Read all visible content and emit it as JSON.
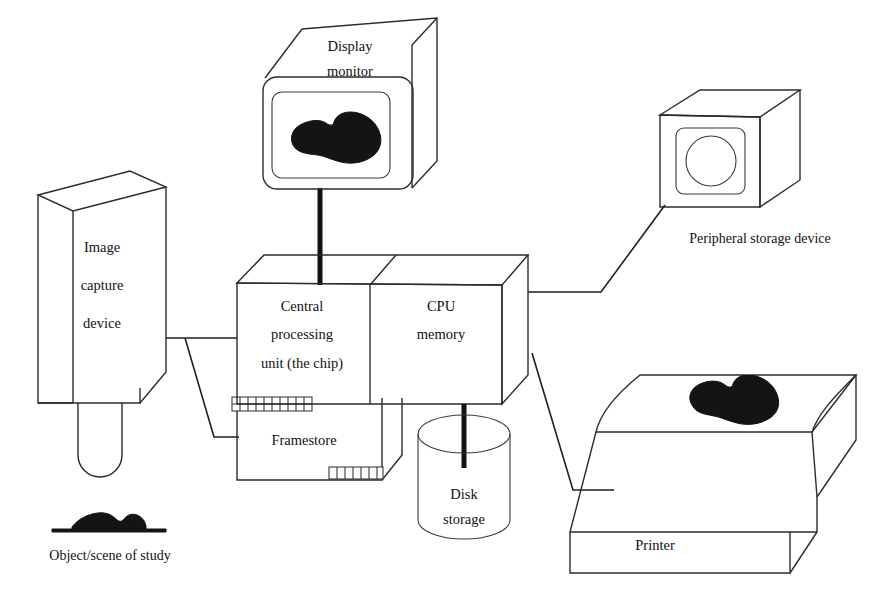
{
  "diagram": {
    "background_color": "#ffffff",
    "line_color": "#2b2b2b",
    "blob_color": "#141414"
  },
  "nodes": {
    "display_monitor": {
      "label_line1": "Display",
      "label_line2": "monitor",
      "icon": "crt-monitor-icon",
      "screen_content": "blob-shape"
    },
    "image_capture_device": {
      "label_line1": "Image",
      "label_line2": "capture",
      "label_line3": "device",
      "icon": "camera-box-icon"
    },
    "central_processing_unit": {
      "label_line1": "Central",
      "label_line2": "processing",
      "label_line3": "unit  (the chip)",
      "icon": "cpu-box-icon"
    },
    "cpu_memory": {
      "label_line1": "CPU",
      "label_line2": "memory",
      "icon": "memory-box-icon"
    },
    "framestore": {
      "label": "Framestore",
      "icon": "framestore-box-icon",
      "chip_combs": 2
    },
    "disk_storage": {
      "label_line1": "Disk",
      "label_line2": "storage",
      "icon": "cylinder-icon"
    },
    "peripheral_storage_device": {
      "label": "Peripheral storage device",
      "icon": "drive-cube-icon"
    },
    "printer": {
      "label": "Printer",
      "icon": "printer-icon",
      "paper_content": "blob-shape"
    },
    "object_scene": {
      "label": "Object/scene of study",
      "icon": "specimen-on-baseline-icon"
    }
  },
  "connections": [
    {
      "name": "cpu-to-display-monitor",
      "from": "central_processing_unit",
      "to": "display_monitor",
      "style": "thick-cable"
    },
    {
      "name": "image-capture-to-cpu",
      "from": "image_capture_device",
      "to": "central_processing_unit",
      "style": "thin-line"
    },
    {
      "name": "image-capture-to-framestore",
      "from": "image_capture_device",
      "to": "framestore",
      "style": "thin-line"
    },
    {
      "name": "cpu-memory-to-peripheral-storage",
      "from": "cpu_memory",
      "to": "peripheral_storage_device",
      "style": "thin-line"
    },
    {
      "name": "cpu-memory-to-disk-storage",
      "from": "cpu_memory",
      "to": "disk_storage",
      "style": "thick-cable"
    },
    {
      "name": "cpu-memory-to-printer",
      "from": "cpu_memory",
      "to": "printer",
      "style": "thin-line"
    }
  ]
}
